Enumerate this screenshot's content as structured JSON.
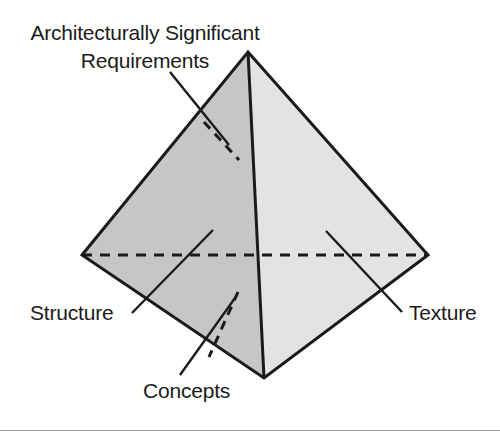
{
  "figure": {
    "type": "tetrahedron-diagram",
    "background_color": "#ffffff"
  },
  "colors": {
    "left_face": "#c6c6c6",
    "right_face": "#e3e3e3",
    "outline": "#1a1a1a",
    "hidden_edge": "#1a1a1a",
    "text": "#1b1b1b",
    "rule": "#9a9a9a"
  },
  "labels": {
    "asr_line1": "Architecturally Significant",
    "asr_line2": "Requirements",
    "structure": "Structure",
    "concepts": "Concepts",
    "texture": "Texture"
  },
  "geometry": {
    "apex": [
      248,
      52
    ],
    "left": [
      82,
      255
    ],
    "right": [
      428,
      255
    ],
    "bottom": [
      264,
      378
    ],
    "hidden_vertex_note": "rear vertex implied by dashed edges"
  },
  "leader_lines": [
    {
      "name": "asr-leader",
      "from": [
        172,
        73
      ],
      "to": [
        228,
        143
      ]
    },
    {
      "name": "structure-leader",
      "from": [
        133,
        312
      ],
      "to": [
        212,
        231
      ]
    },
    {
      "name": "concepts-leader",
      "from": [
        181,
        374
      ],
      "to": [
        234,
        299
      ]
    },
    {
      "name": "texture-leader",
      "from": [
        400,
        311
      ],
      "to": [
        327,
        232
      ]
    }
  ],
  "hidden_edges": [
    {
      "name": "rear-vertical-edge",
      "from": [
        204,
        122
      ],
      "to": [
        237,
        158
      ]
    },
    {
      "name": "rear-base-edge",
      "from": [
        82,
        255
      ],
      "to": [
        428,
        255
      ]
    },
    {
      "name": "rear-bottom-edge",
      "from": [
        237,
        290
      ],
      "to": [
        209,
        355
      ]
    }
  ]
}
